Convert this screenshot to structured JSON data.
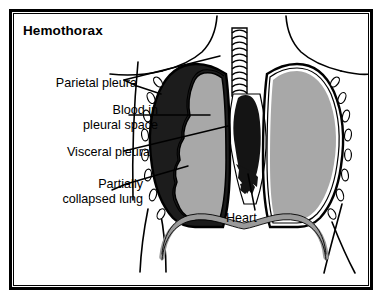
{
  "figure": {
    "title": "Hemothorax",
    "kind": "anatomical-illustration"
  },
  "labels": {
    "parietal_pleura": "Parietal pleura",
    "blood_in_pleural_space": "Blood in\npleural space",
    "visceral_pleura": "Visceral pleura",
    "partially_collapsed_lung": "Partially\ncollapsed lung",
    "heart": "Heart"
  },
  "colors": {
    "outline": "#000000",
    "background": "#ffffff",
    "lung_tissue": "#a8a8a8",
    "blood": "#1c1c1c",
    "heart": "#141414",
    "diaphragm": "#9a9a9a",
    "pleura_line": "#000000",
    "rib": "#ffffff"
  },
  "anatomy": {
    "parts": [
      "trachea",
      "right lung",
      "partially collapsed left lung",
      "blood in pleural space",
      "parietal pleura",
      "visceral pleura",
      "heart",
      "diaphragm",
      "ribs",
      "neck and shoulder contour",
      "abdominal contour"
    ],
    "rib_count_left": 8,
    "rib_count_right": 8,
    "trachea_rings": 11
  }
}
